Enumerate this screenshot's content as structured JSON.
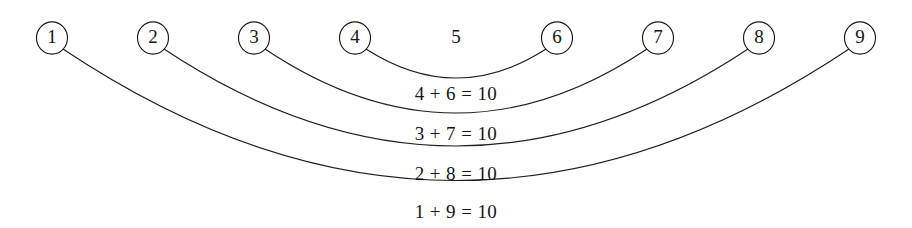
{
  "diagram": {
    "background_color": "#ffffff",
    "stroke_color": "#1f1f1f",
    "text_color": "#151515",
    "width": 912,
    "height": 228
  },
  "nodes": [
    {
      "label": "1",
      "cx": 52,
      "cy": 38,
      "r": 15.5,
      "circled": true
    },
    {
      "label": "2",
      "cx": 153,
      "cy": 38,
      "r": 15.5,
      "circled": true
    },
    {
      "label": "3",
      "cx": 254,
      "cy": 38,
      "r": 15.5,
      "circled": true
    },
    {
      "label": "4",
      "cx": 355,
      "cy": 38,
      "r": 15.5,
      "circled": true
    },
    {
      "label": "5",
      "cx": 456,
      "cy": 38,
      "r": 15.5,
      "circled": false
    },
    {
      "label": "6",
      "cx": 557,
      "cy": 38,
      "r": 15.5,
      "circled": true
    },
    {
      "label": "7",
      "cx": 658,
      "cy": 38,
      "r": 15.5,
      "circled": true
    },
    {
      "label": "8",
      "cx": 759,
      "cy": 38,
      "r": 15.5,
      "circled": true
    },
    {
      "label": "9",
      "cx": 860,
      "cy": 38,
      "r": 15.5,
      "circled": true
    }
  ],
  "arcs": [
    {
      "name": "arc-4-6",
      "from": "4",
      "to": "6",
      "x1": 366,
      "y1": 49,
      "x2": 546,
      "y2": 49,
      "cx": 456,
      "cy": 107,
      "bottom_y": 82
    },
    {
      "name": "arc-3-7",
      "from": "3",
      "to": "7",
      "x1": 265,
      "y1": 49,
      "x2": 647,
      "y2": 49,
      "cx": 456,
      "cy": 177,
      "bottom_y": 122
    },
    {
      "name": "arc-2-8",
      "from": "2",
      "to": "8",
      "x1": 164,
      "y1": 49,
      "x2": 748,
      "y2": 49,
      "cx": 456,
      "cy": 243,
      "bottom_y": 160
    },
    {
      "name": "arc-1-9",
      "from": "1",
      "to": "9",
      "x1": 63,
      "y1": 49,
      "x2": 849,
      "y2": 49,
      "cx": 456,
      "cy": 312,
      "bottom_y": 198
    }
  ],
  "equations": [
    {
      "text": "4 + 6 = 10",
      "x": 456,
      "y": 96,
      "pair": [
        4,
        6
      ],
      "sum": 10
    },
    {
      "text": "3 + 7 = 10",
      "x": 456,
      "y": 136,
      "pair": [
        3,
        7
      ],
      "sum": 10
    },
    {
      "text": "2 + 8 = 10",
      "x": 456,
      "y": 176,
      "pair": [
        2,
        8
      ],
      "sum": 10
    },
    {
      "text": "1 + 9 = 10",
      "x": 456,
      "y": 214,
      "pair": [
        1,
        9
      ],
      "sum": 10
    }
  ]
}
